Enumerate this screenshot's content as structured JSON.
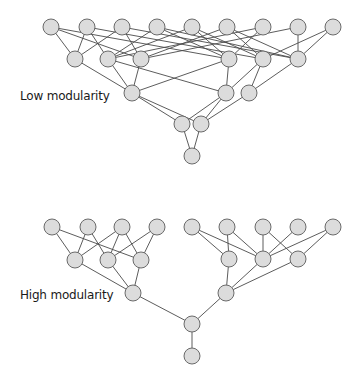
{
  "labels": {
    "low": "Low modularity",
    "high": "High modularity"
  },
  "colors": {
    "node_fill": "#dcdcdc",
    "node_stroke": "#6a6a6a",
    "edge": "#4a4a4a"
  },
  "node_radius": 8,
  "networks": [
    {
      "name": "low-modularity-network",
      "nodes": {
        "t1": [
          51,
          27
        ],
        "t2": [
          87,
          27
        ],
        "t3": [
          122,
          27
        ],
        "t4": [
          157,
          27
        ],
        "t5": [
          192,
          27
        ],
        "t6": [
          227,
          27
        ],
        "t7": [
          263,
          27
        ],
        "t8": [
          298,
          27
        ],
        "t9": [
          333,
          27
        ],
        "s1": [
          75,
          59
        ],
        "s2": [
          108,
          59
        ],
        "s3": [
          141,
          59
        ],
        "s4": [
          229,
          59
        ],
        "s5": [
          263,
          59
        ],
        "s6": [
          298,
          59
        ],
        "m1": [
          132,
          93
        ],
        "m2": [
          226,
          93
        ],
        "m3": [
          249,
          93
        ],
        "l1": [
          182,
          124
        ],
        "l2": [
          201,
          124
        ],
        "b": [
          192,
          156
        ]
      },
      "edges": [
        [
          "t1",
          "s1"
        ],
        [
          "t1",
          "s3"
        ],
        [
          "t1",
          "s4"
        ],
        [
          "t2",
          "s1"
        ],
        [
          "t2",
          "s2"
        ],
        [
          "t2",
          "s5"
        ],
        [
          "t3",
          "s1"
        ],
        [
          "t3",
          "s3"
        ],
        [
          "t3",
          "s6"
        ],
        [
          "t4",
          "s2"
        ],
        [
          "t4",
          "s4"
        ],
        [
          "t4",
          "s6"
        ],
        [
          "t5",
          "s2"
        ],
        [
          "t5",
          "s4"
        ],
        [
          "t5",
          "s5"
        ],
        [
          "t6",
          "s3"
        ],
        [
          "t6",
          "s5"
        ],
        [
          "t6",
          "s6"
        ],
        [
          "t7",
          "s2"
        ],
        [
          "t7",
          "s4"
        ],
        [
          "t8",
          "s3"
        ],
        [
          "t8",
          "s6"
        ],
        [
          "t9",
          "s5"
        ],
        [
          "t9",
          "s6"
        ],
        [
          "s1",
          "m1"
        ],
        [
          "s2",
          "m1"
        ],
        [
          "s2",
          "m2"
        ],
        [
          "s3",
          "m1"
        ],
        [
          "s4",
          "m1"
        ],
        [
          "s4",
          "m2"
        ],
        [
          "s5",
          "m2"
        ],
        [
          "s5",
          "m3"
        ],
        [
          "s6",
          "m3"
        ],
        [
          "m1",
          "l1"
        ],
        [
          "m1",
          "l2"
        ],
        [
          "m2",
          "l1"
        ],
        [
          "m2",
          "l2"
        ],
        [
          "m3",
          "l2"
        ],
        [
          "l1",
          "b"
        ],
        [
          "l2",
          "b"
        ]
      ]
    },
    {
      "name": "high-modularity-network",
      "nodes": {
        "a1": [
          52,
          227
        ],
        "a2": [
          88,
          227
        ],
        "a3": [
          122,
          227
        ],
        "a4": [
          157,
          227
        ],
        "b1": [
          75,
          260
        ],
        "b2": [
          108,
          260
        ],
        "b3": [
          141,
          260
        ],
        "c1": [
          133,
          293
        ],
        "r1": [
          192,
          227
        ],
        "r2": [
          227,
          227
        ],
        "r3": [
          263,
          227
        ],
        "r4": [
          298,
          227
        ],
        "r5": [
          333,
          227
        ],
        "q1": [
          229,
          259
        ],
        "q2": [
          263,
          259
        ],
        "q3": [
          298,
          259
        ],
        "c2": [
          226,
          293
        ],
        "hub": [
          192,
          324
        ],
        "root": [
          192,
          356
        ]
      },
      "edges": [
        [
          "a1",
          "b1"
        ],
        [
          "a1",
          "b3"
        ],
        [
          "a2",
          "b1"
        ],
        [
          "a2",
          "b2"
        ],
        [
          "a3",
          "b1"
        ],
        [
          "a3",
          "b2"
        ],
        [
          "a3",
          "b3"
        ],
        [
          "a4",
          "b2"
        ],
        [
          "a4",
          "b3"
        ],
        [
          "b1",
          "c1"
        ],
        [
          "b2",
          "c1"
        ],
        [
          "b3",
          "c1"
        ],
        [
          "r1",
          "q1"
        ],
        [
          "r1",
          "q2"
        ],
        [
          "r2",
          "q1"
        ],
        [
          "r2",
          "q2"
        ],
        [
          "r3",
          "q2"
        ],
        [
          "r3",
          "q3"
        ],
        [
          "r4",
          "q2"
        ],
        [
          "r5",
          "q2"
        ],
        [
          "r5",
          "q3"
        ],
        [
          "q1",
          "c2"
        ],
        [
          "q2",
          "c2"
        ],
        [
          "q3",
          "c2"
        ],
        [
          "c1",
          "hub"
        ],
        [
          "c2",
          "hub"
        ],
        [
          "hub",
          "root"
        ]
      ]
    }
  ]
}
